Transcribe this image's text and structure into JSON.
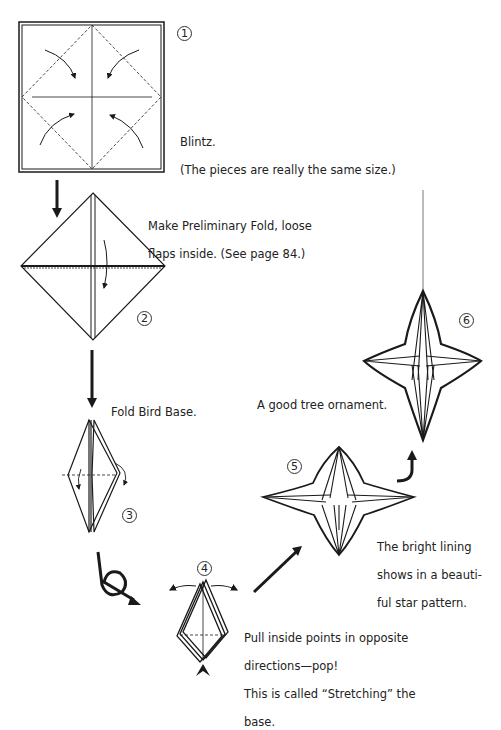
{
  "steps": [
    {
      "number": "1",
      "caption_line1": "Blintz.",
      "caption_line2": "(The pieces are really the same size.)"
    },
    {
      "number": "2",
      "caption_line1": "Make Preliminary Fold, loose",
      "caption_line2": "flaps inside. (See page 84.)"
    },
    {
      "number": "3",
      "caption": "Fold Bird Base."
    },
    {
      "number": "4",
      "caption_line1": "Pull inside points in opposite",
      "caption_line2": "directions—pop!",
      "caption_line3": "This is called “Stretching” the",
      "caption_line4": "base."
    },
    {
      "number": "5",
      "caption_line1": "The bright lining",
      "caption_line2": "shows in a beauti-",
      "caption_line3": "ful star pattern."
    },
    {
      "number": "6",
      "caption": "A good tree ornament."
    }
  ],
  "icons": [
    "fold-arrow-icon",
    "down-arrow-icon",
    "turn-over-icon",
    "stretch-arrow-icon",
    "diagonal-arrow-icon",
    "up-hook-arrow-icon",
    "push-arrowhead-icon",
    "hanging-string"
  ],
  "colors": {
    "ink": "#1a1a1a",
    "paper": "#ffffff"
  }
}
